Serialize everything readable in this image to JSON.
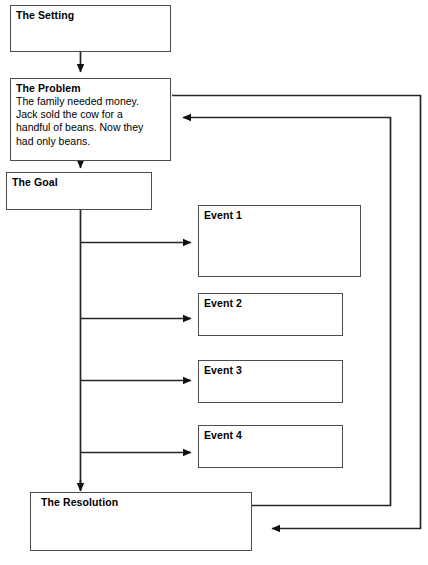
{
  "diagram": {
    "background_color": "#ffffff",
    "line_color": "#262626",
    "box_border_color": "#4d4d4d",
    "text_color": "#000000"
  },
  "nodes": {
    "setting": {
      "title": "The Setting",
      "body_lines": []
    },
    "problem": {
      "title": "The Problem",
      "body_lines": [
        "The family needed money.",
        "Jack sold the cow for a",
        "handful of beans. Now they",
        "had only beans."
      ]
    },
    "goal": {
      "title": "The Goal",
      "body_lines": []
    },
    "event1": {
      "title": "Event 1",
      "body_lines": []
    },
    "event2": {
      "title": "Event 2",
      "body_lines": []
    },
    "event3": {
      "title": "Event 3",
      "body_lines": []
    },
    "event4": {
      "title": "Event 4",
      "body_lines": []
    },
    "resolution": {
      "title": "The Resolution",
      "body_lines": []
    }
  },
  "connectors": [
    {
      "name": "setting-to-problem",
      "from": "setting",
      "to": "problem",
      "arrow": true
    },
    {
      "name": "problem-to-goal",
      "from": "problem",
      "to": "goal",
      "arrow": true
    },
    {
      "name": "goal-to-event1",
      "from": "goal",
      "to": "event1",
      "arrow": true
    },
    {
      "name": "goal-to-event2",
      "from": "goal",
      "to": "event2",
      "arrow": true
    },
    {
      "name": "goal-to-event3",
      "from": "goal",
      "to": "event3",
      "arrow": true
    },
    {
      "name": "goal-to-event4",
      "from": "goal",
      "to": "event4",
      "arrow": true
    },
    {
      "name": "goal-to-resolution",
      "from": "goal",
      "to": "resolution",
      "arrow": true
    },
    {
      "name": "problem-to-resolution-loop",
      "from": "problem",
      "to": "resolution",
      "arrow": true
    },
    {
      "name": "resolution-to-problem-loop",
      "from": "resolution",
      "to": "problem",
      "arrow": true
    }
  ]
}
